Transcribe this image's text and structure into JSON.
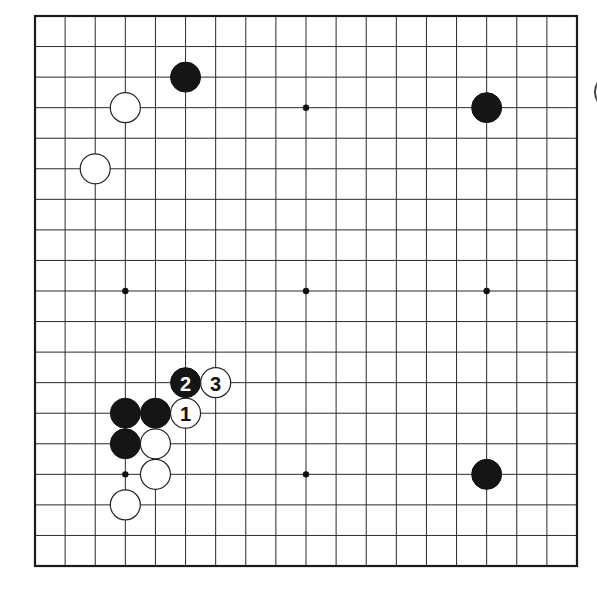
{
  "diagram": {
    "type": "go-board",
    "board_size": 19,
    "colors": {
      "background": "#ffffff",
      "line": "#2a2a2a",
      "black_stone": "#151515",
      "white_stone": "#ffffff"
    },
    "hoshi": [
      {
        "col": 9,
        "row": 3
      },
      {
        "col": 15,
        "row": 3
      },
      {
        "col": 3,
        "row": 9
      },
      {
        "col": 9,
        "row": 9
      },
      {
        "col": 15,
        "row": 9
      },
      {
        "col": 3,
        "row": 15
      },
      {
        "col": 9,
        "row": 15
      },
      {
        "col": 15,
        "row": 15
      },
      {
        "col": 3,
        "row": 3
      }
    ],
    "stones": [
      {
        "color": "black",
        "col": 5,
        "row": 2,
        "label": ""
      },
      {
        "color": "white",
        "col": 3,
        "row": 3,
        "label": ""
      },
      {
        "color": "white",
        "col": 2,
        "row": 5,
        "label": ""
      },
      {
        "color": "black",
        "col": 15,
        "row": 3,
        "label": ""
      },
      {
        "color": "black",
        "col": 3,
        "row": 13,
        "label": ""
      },
      {
        "color": "black",
        "col": 4,
        "row": 13,
        "label": ""
      },
      {
        "color": "white",
        "col": 5,
        "row": 13,
        "label": "1"
      },
      {
        "color": "black",
        "col": 5,
        "row": 12,
        "label": "2"
      },
      {
        "color": "white",
        "col": 6,
        "row": 12,
        "label": "3"
      },
      {
        "color": "black",
        "col": 3,
        "row": 14,
        "label": ""
      },
      {
        "color": "white",
        "col": 4,
        "row": 14,
        "label": ""
      },
      {
        "color": "white",
        "col": 4,
        "row": 15,
        "label": ""
      },
      {
        "color": "white",
        "col": 3,
        "row": 16,
        "label": ""
      },
      {
        "color": "black",
        "col": 15,
        "row": 15,
        "label": ""
      }
    ]
  }
}
